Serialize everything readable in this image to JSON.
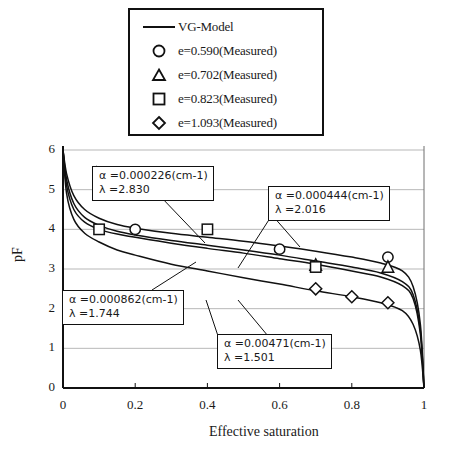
{
  "legend": {
    "entries": [
      {
        "marker": "line",
        "label": "VG-Model"
      },
      {
        "marker": "circle-icon",
        "label": "e=0.590(Measured)"
      },
      {
        "marker": "triangle-icon",
        "label": "e=0.702(Measured)"
      },
      {
        "marker": "square-icon",
        "label": "e=0.823(Measured)"
      },
      {
        "marker": "diamond-icon",
        "label": "e=1.093(Measured)"
      }
    ]
  },
  "annotations": [
    {
      "id": "ann1",
      "line1": "α =0.000226(cm-1)",
      "line2": "λ =2.830"
    },
    {
      "id": "ann2",
      "line1": "α =0.000444(cm-1)",
      "line2": "λ =2.016"
    },
    {
      "id": "ann3",
      "line1": "α =0.000862(cm-1)",
      "line2": "λ =1.744"
    },
    {
      "id": "ann4",
      "line1": "α =0.00471(cm-1)",
      "line2": "λ =1.501"
    }
  ],
  "axes": {
    "x_title": "Effective saturation",
    "y_title": "pF",
    "x_ticks": [
      "0",
      "0.2",
      "0.4",
      "0.6",
      "0.8",
      "1"
    ],
    "y_ticks": [
      "0",
      "1",
      "2",
      "3",
      "4",
      "5",
      "6"
    ]
  },
  "chart_data": {
    "type": "line",
    "title": "",
    "xlabel": "Effective saturation",
    "ylabel": "pF",
    "xlim": [
      0,
      1
    ],
    "ylim": [
      0,
      6
    ],
    "xticks": [
      0,
      0.2,
      0.4,
      0.6,
      0.8,
      1
    ],
    "yticks": [
      0,
      1,
      2,
      3,
      4,
      5,
      6
    ],
    "grid": true,
    "legend_position": "above-plot",
    "series": [
      {
        "name": "VG-Model e=0.590",
        "type": "line",
        "alpha": 0.000226,
        "lambda": 2.83,
        "x": [
          0,
          0.01,
          0.03,
          0.06,
          0.1,
          0.15,
          0.2,
          0.3,
          0.4,
          0.5,
          0.6,
          0.7,
          0.8,
          0.88,
          0.94,
          0.97,
          0.99,
          1.0
        ],
        "y": [
          6.0,
          5.4,
          4.85,
          4.5,
          4.28,
          4.12,
          4.03,
          3.9,
          3.8,
          3.7,
          3.58,
          3.45,
          3.3,
          3.15,
          2.95,
          2.55,
          1.6,
          0.0
        ]
      },
      {
        "name": "VG-Model e=0.702",
        "type": "line",
        "alpha": 0.000444,
        "lambda": 2.016,
        "x": [
          0,
          0.01,
          0.03,
          0.06,
          0.1,
          0.15,
          0.2,
          0.3,
          0.4,
          0.5,
          0.6,
          0.7,
          0.8,
          0.88,
          0.94,
          0.97,
          0.99,
          1.0
        ],
        "y": [
          6.0,
          5.25,
          4.65,
          4.3,
          4.1,
          3.95,
          3.86,
          3.72,
          3.6,
          3.48,
          3.35,
          3.2,
          3.05,
          2.9,
          2.68,
          2.35,
          1.45,
          0.0
        ]
      },
      {
        "name": "VG-Model e=0.823",
        "type": "line",
        "alpha": 0.000862,
        "lambda": 1.744,
        "x": [
          0,
          0.01,
          0.03,
          0.06,
          0.1,
          0.15,
          0.2,
          0.3,
          0.4,
          0.5,
          0.6,
          0.7,
          0.8,
          0.88,
          0.94,
          0.97,
          0.99,
          1.0
        ],
        "y": [
          6.0,
          5.1,
          4.5,
          4.18,
          4.0,
          3.88,
          3.8,
          3.65,
          3.52,
          3.4,
          3.26,
          3.12,
          2.95,
          2.8,
          2.58,
          2.25,
          1.35,
          0.0
        ]
      },
      {
        "name": "VG-Model e=1.093",
        "type": "line",
        "alpha": 0.00471,
        "lambda": 1.501,
        "x": [
          0,
          0.01,
          0.03,
          0.06,
          0.1,
          0.15,
          0.2,
          0.3,
          0.4,
          0.5,
          0.6,
          0.7,
          0.8,
          0.88,
          0.94,
          0.97,
          0.99,
          1.0
        ],
        "y": [
          6.0,
          4.9,
          4.25,
          3.9,
          3.68,
          3.48,
          3.35,
          3.12,
          2.95,
          2.78,
          2.62,
          2.45,
          2.3,
          2.15,
          1.95,
          1.6,
          0.95,
          0.0
        ]
      },
      {
        "name": "e=0.590(Measured)",
        "type": "scatter",
        "marker": "circle",
        "x": [
          0.2,
          0.6,
          0.9
        ],
        "y": [
          4.0,
          3.5,
          3.3
        ]
      },
      {
        "name": "e=0.702(Measured)",
        "type": "scatter",
        "marker": "triangle",
        "x": [
          0.7,
          0.9
        ],
        "y": [
          3.1,
          3.05
        ]
      },
      {
        "name": "e=0.823(Measured)",
        "type": "scatter",
        "marker": "square",
        "x": [
          0.1,
          0.4,
          0.7
        ],
        "y": [
          4.0,
          4.0,
          3.05
        ]
      },
      {
        "name": "e=1.093(Measured)",
        "type": "scatter",
        "marker": "diamond",
        "x": [
          0.7,
          0.8,
          0.9
        ],
        "y": [
          2.5,
          2.3,
          2.15
        ]
      }
    ]
  }
}
